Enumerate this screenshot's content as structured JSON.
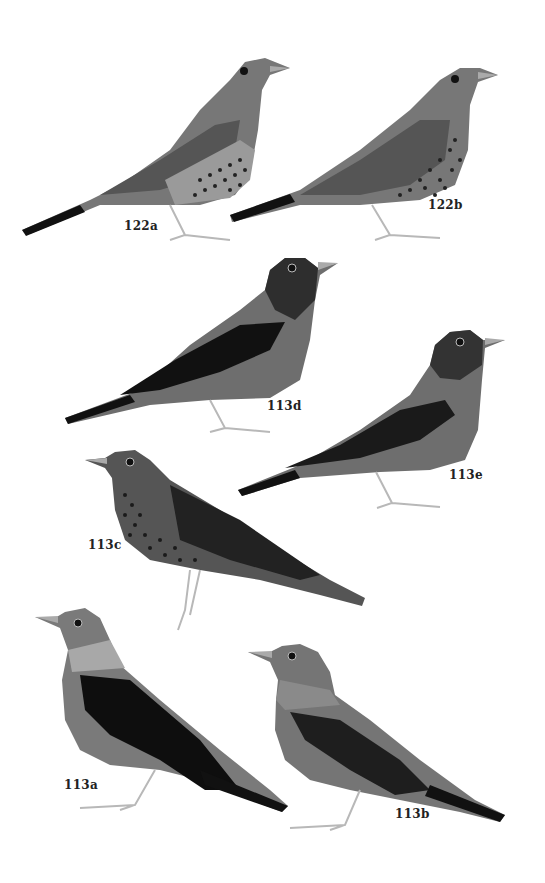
{
  "plate": {
    "background": "#ffffff",
    "figures": [
      {
        "id": "122a",
        "label": "122a",
        "pose": "facing-right",
        "pattern": "spotted-breast"
      },
      {
        "id": "122b",
        "label": "122b",
        "pose": "facing-right",
        "pattern": "heavily-spotted-breast"
      },
      {
        "id": "113d",
        "label": "113d",
        "pose": "facing-right",
        "pattern": "dark-hood-dark-wing"
      },
      {
        "id": "113e",
        "label": "113e",
        "pose": "facing-right",
        "pattern": "dark-hood-dark-wing"
      },
      {
        "id": "113c",
        "label": "113c",
        "pose": "facing-left-perched",
        "pattern": "spotted-breast"
      },
      {
        "id": "113a",
        "label": "113a",
        "pose": "facing-left",
        "pattern": "pale-collar-black-wing"
      },
      {
        "id": "113b",
        "label": "113b",
        "pose": "facing-left",
        "pattern": "pale-collar-dark-wing"
      }
    ]
  },
  "colors": {
    "body_mid": "#6e6e6e",
    "body_dark": "#3a3a3a",
    "wing_black": "#111111",
    "legs": "#b8b8b8",
    "label": "#222222"
  }
}
